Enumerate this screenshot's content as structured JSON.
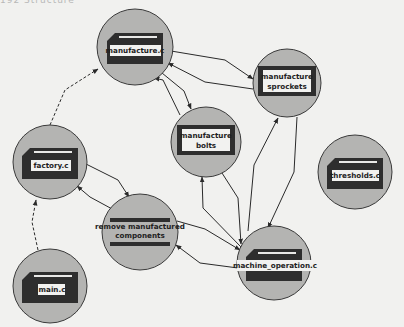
{
  "header": {
    "cut_off_text": "192    Structure"
  },
  "colors": {
    "background": "#f1f1ef",
    "node_fill": "#b4b4b2",
    "node_stroke": "#3a3a3a",
    "file_body": "#2e2e2e",
    "label_box": "#f2f2f0",
    "edge": "#2a2a2a"
  },
  "nodes": [
    {
      "id": "manufacture_c",
      "label": "manufacture.c",
      "kind": "file",
      "cx": 135,
      "cy": 47,
      "r": 38
    },
    {
      "id": "manufacture_sprockets",
      "label_lines": [
        "manufacture",
        "sprockets"
      ],
      "kind": "module",
      "cx": 287,
      "cy": 83,
      "r": 34
    },
    {
      "id": "manufacture_bolts",
      "label_lines": [
        "manufacture",
        "bolts"
      ],
      "kind": "module",
      "cx": 206,
      "cy": 142,
      "r": 35
    },
    {
      "id": "factory_c",
      "label": "factory.c",
      "kind": "file",
      "cx": 50,
      "cy": 162,
      "r": 37
    },
    {
      "id": "thresholds_c",
      "label": "thresholds.c",
      "kind": "file",
      "cx": 355,
      "cy": 172,
      "r": 37
    },
    {
      "id": "remove_manufactured_components",
      "label_lines": [
        "remove manufactured",
        "components"
      ],
      "kind": "datastore",
      "cx": 140,
      "cy": 232,
      "r": 38
    },
    {
      "id": "machine_operation_c",
      "label": "machine_operation.c",
      "kind": "file",
      "cx": 274,
      "cy": 263,
      "r": 37
    },
    {
      "id": "main_c",
      "label": "main.c",
      "kind": "file",
      "cx": 50,
      "cy": 286,
      "r": 37
    }
  ],
  "edges": [
    {
      "from": "main_c",
      "to": "factory_c",
      "style": "dashed"
    },
    {
      "from": "factory_c",
      "to": "manufacture_c",
      "style": "dashed"
    },
    {
      "from": "manufacture_c",
      "to": "manufacture_sprockets",
      "style": "solid"
    },
    {
      "from": "manufacture_sprockets",
      "to": "manufacture_c",
      "style": "solid"
    },
    {
      "from": "manufacture_c",
      "to": "manufacture_bolts",
      "style": "solid"
    },
    {
      "from": "manufacture_bolts",
      "to": "manufacture_c",
      "style": "solid"
    },
    {
      "from": "factory_c",
      "to": "remove_manufactured_components",
      "style": "solid"
    },
    {
      "from": "remove_manufactured_components",
      "to": "factory_c",
      "style": "solid"
    },
    {
      "from": "remove_manufactured_components",
      "to": "machine_operation_c",
      "style": "solid"
    },
    {
      "from": "machine_operation_c",
      "to": "remove_manufactured_components",
      "style": "solid"
    },
    {
      "from": "machine_operation_c",
      "to": "manufacture_bolts",
      "style": "solid"
    },
    {
      "from": "manufacture_bolts",
      "to": "machine_operation_c",
      "style": "solid"
    },
    {
      "from": "machine_operation_c",
      "to": "manufacture_sprockets",
      "style": "solid"
    },
    {
      "from": "manufacture_sprockets",
      "to": "machine_operation_c",
      "style": "solid"
    },
    {
      "from": "machine_operation_c",
      "to": "manufacture_c",
      "style": "solid"
    }
  ]
}
